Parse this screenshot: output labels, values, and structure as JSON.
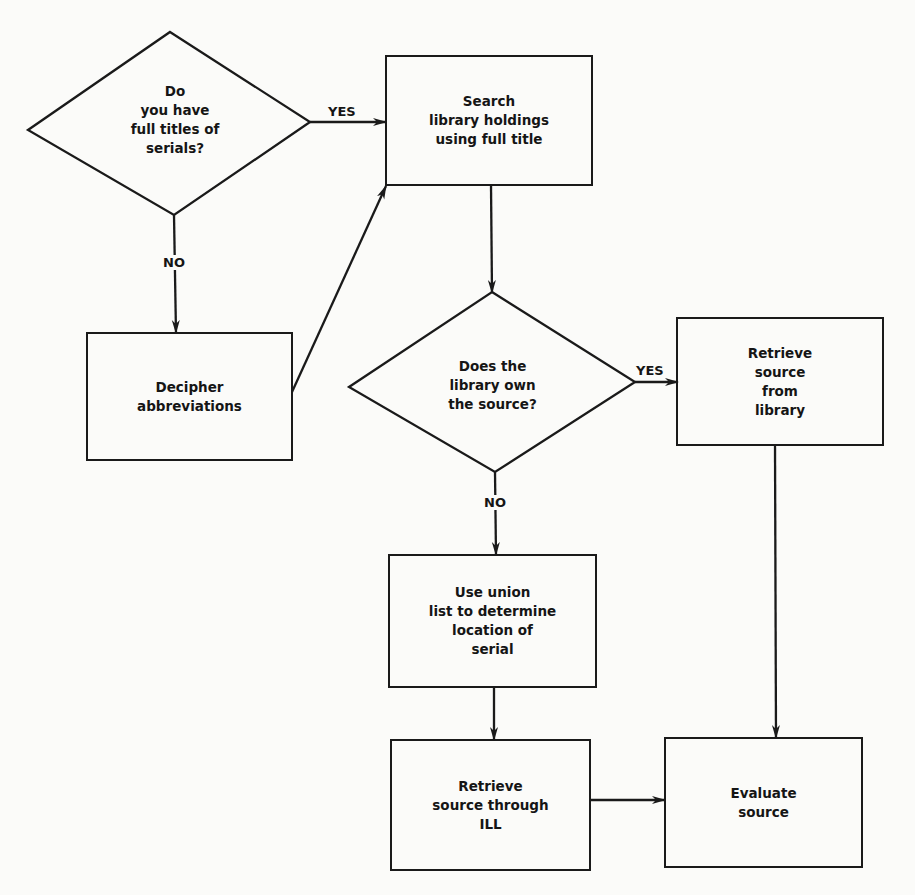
{
  "diagram": {
    "type": "flowchart",
    "colors": {
      "background": "#fbfbf9",
      "stroke": "#1a1a1a",
      "text": "#151515"
    },
    "nodes": {
      "q_full_titles": {
        "shape": "diamond",
        "text": "Do\nyou have\nfull titles of\nserials?"
      },
      "search_holdings": {
        "shape": "rect",
        "text": "Search\nlibrary holdings\nusing full title"
      },
      "decipher": {
        "shape": "rect",
        "text": "Decipher\nabbreviations"
      },
      "q_library_owns": {
        "shape": "diamond",
        "text": "Does the\nlibrary own\nthe source?"
      },
      "retrieve_library": {
        "shape": "rect",
        "text": "Retrieve\nsource\nfrom\nlibrary"
      },
      "union_list": {
        "shape": "rect",
        "text": "Use union\nlist to determine\nlocation of\nserial"
      },
      "retrieve_ill": {
        "shape": "rect",
        "text": "Retrieve\nsource through\nILL"
      },
      "evaluate": {
        "shape": "rect",
        "text": "Evaluate\nsource"
      }
    },
    "edge_labels": {
      "q1_yes": "YES",
      "q1_no": "NO",
      "q2_yes": "YES",
      "q2_no": "NO"
    },
    "edges": [
      {
        "from": "q_full_titles",
        "to": "search_holdings",
        "label": "YES"
      },
      {
        "from": "q_full_titles",
        "to": "decipher",
        "label": "NO"
      },
      {
        "from": "decipher",
        "to": "search_holdings",
        "label": ""
      },
      {
        "from": "search_holdings",
        "to": "q_library_owns",
        "label": ""
      },
      {
        "from": "q_library_owns",
        "to": "retrieve_library",
        "label": "YES"
      },
      {
        "from": "q_library_owns",
        "to": "union_list",
        "label": "NO"
      },
      {
        "from": "retrieve_library",
        "to": "evaluate",
        "label": ""
      },
      {
        "from": "union_list",
        "to": "retrieve_ill",
        "label": ""
      },
      {
        "from": "retrieve_ill",
        "to": "evaluate",
        "label": ""
      }
    ]
  }
}
